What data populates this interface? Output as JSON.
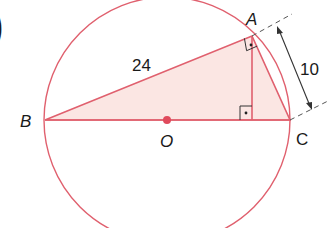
{
  "figure": {
    "partial_label": ")",
    "points": {
      "A": "A",
      "B": "B",
      "C": "C",
      "O": "O"
    },
    "lengths": {
      "AB": "24",
      "AC": "10"
    },
    "right_angles": [
      "BAC",
      "AHC"
    ],
    "colors": {
      "stroke": "#e0606e",
      "fill": "#fbe6e3",
      "center_dot": "#e04a5c",
      "dim_line": "#333333",
      "text": "#1a1a1a"
    }
  }
}
